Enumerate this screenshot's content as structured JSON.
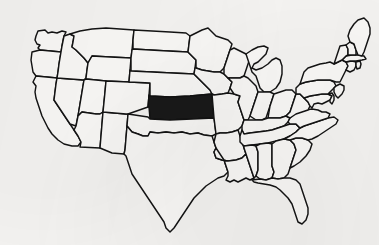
{
  "figure": {
    "kind": "choropleth-outline-map",
    "subject_country": "United States of America",
    "projection_note": "contiguous 48 states, no Alaska or Hawaii shown",
    "width_px": 379,
    "height_px": 245,
    "background_color": "#f6f5f3",
    "outline_color": "#131313",
    "state_fill_color": "#fbfaf8",
    "highlight_fill_color": "#191919",
    "style_note": "black-and-white scanned line-art outline map",
    "visible_labels": [],
    "legend": null
  },
  "highlight": {
    "count": 1,
    "highlighted_states": [
      "Kansas"
    ],
    "highlighted_state_name": "Kansas",
    "highlighted_state_code": "KS",
    "fill_description": "solid black",
    "approx_bbox_px": {
      "x": 163,
      "y": 113,
      "width": 49,
      "height": 25
    }
  },
  "states": [
    {
      "code": "WA",
      "name": "Washington",
      "highlighted": false
    },
    {
      "code": "OR",
      "name": "Oregon",
      "highlighted": false
    },
    {
      "code": "CA",
      "name": "California",
      "highlighted": false
    },
    {
      "code": "NV",
      "name": "Nevada",
      "highlighted": false
    },
    {
      "code": "ID",
      "name": "Idaho",
      "highlighted": false
    },
    {
      "code": "MT",
      "name": "Montana",
      "highlighted": false
    },
    {
      "code": "WY",
      "name": "Wyoming",
      "highlighted": false
    },
    {
      "code": "UT",
      "name": "Utah",
      "highlighted": false
    },
    {
      "code": "AZ",
      "name": "Arizona",
      "highlighted": false
    },
    {
      "code": "NM",
      "name": "New Mexico",
      "highlighted": false
    },
    {
      "code": "CO",
      "name": "Colorado",
      "highlighted": false
    },
    {
      "code": "ND",
      "name": "North Dakota",
      "highlighted": false
    },
    {
      "code": "SD",
      "name": "South Dakota",
      "highlighted": false
    },
    {
      "code": "NE",
      "name": "Nebraska",
      "highlighted": false
    },
    {
      "code": "KS",
      "name": "Kansas",
      "highlighted": true
    },
    {
      "code": "OK",
      "name": "Oklahoma",
      "highlighted": false
    },
    {
      "code": "TX",
      "name": "Texas",
      "highlighted": false
    },
    {
      "code": "MN",
      "name": "Minnesota",
      "highlighted": false
    },
    {
      "code": "IA",
      "name": "Iowa",
      "highlighted": false
    },
    {
      "code": "MO",
      "name": "Missouri",
      "highlighted": false
    },
    {
      "code": "AR",
      "name": "Arkansas",
      "highlighted": false
    },
    {
      "code": "LA",
      "name": "Louisiana",
      "highlighted": false
    },
    {
      "code": "WI",
      "name": "Wisconsin",
      "highlighted": false
    },
    {
      "code": "IL",
      "name": "Illinois",
      "highlighted": false
    },
    {
      "code": "MI",
      "name": "Michigan",
      "highlighted": false
    },
    {
      "code": "IN",
      "name": "Indiana",
      "highlighted": false
    },
    {
      "code": "OH",
      "name": "Ohio",
      "highlighted": false
    },
    {
      "code": "KY",
      "name": "Kentucky",
      "highlighted": false
    },
    {
      "code": "TN",
      "name": "Tennessee",
      "highlighted": false
    },
    {
      "code": "MS",
      "name": "Mississippi",
      "highlighted": false
    },
    {
      "code": "AL",
      "name": "Alabama",
      "highlighted": false
    },
    {
      "code": "GA",
      "name": "Georgia",
      "highlighted": false
    },
    {
      "code": "FL",
      "name": "Florida",
      "highlighted": false
    },
    {
      "code": "SC",
      "name": "South Carolina",
      "highlighted": false
    },
    {
      "code": "NC",
      "name": "North Carolina",
      "highlighted": false
    },
    {
      "code": "VA",
      "name": "Virginia",
      "highlighted": false
    },
    {
      "code": "WV",
      "name": "West Virginia",
      "highlighted": false
    },
    {
      "code": "MD",
      "name": "Maryland",
      "highlighted": false
    },
    {
      "code": "DE",
      "name": "Delaware",
      "highlighted": false
    },
    {
      "code": "PA",
      "name": "Pennsylvania",
      "highlighted": false
    },
    {
      "code": "NJ",
      "name": "New Jersey",
      "highlighted": false
    },
    {
      "code": "NY",
      "name": "New York",
      "highlighted": false
    },
    {
      "code": "CT",
      "name": "Connecticut",
      "highlighted": false
    },
    {
      "code": "RI",
      "name": "Rhode Island",
      "highlighted": false
    },
    {
      "code": "MA",
      "name": "Massachusetts",
      "highlighted": false
    },
    {
      "code": "VT",
      "name": "Vermont",
      "highlighted": false
    },
    {
      "code": "NH",
      "name": "New Hampshire",
      "highlighted": false
    },
    {
      "code": "ME",
      "name": "Maine",
      "highlighted": false
    }
  ]
}
